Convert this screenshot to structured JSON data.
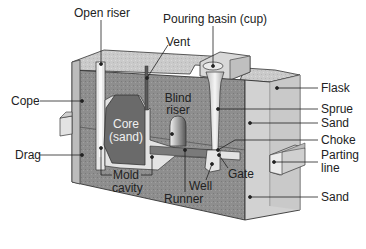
{
  "diagram": {
    "colors": {
      "sand_fill": "#8c8c8c",
      "sand_top": "#c9c9c9",
      "flask_side": "#d4d4d4",
      "core_fill": "#6b6b6b",
      "cavity": "#e6e6e6",
      "outline": "#333333",
      "text": "#222222"
    },
    "labels": {
      "open_riser": "Open riser",
      "pouring_basin": "Pouring basin (cup)",
      "vent": "Vent",
      "cope": "Cope",
      "flask": "Flask",
      "core_line1": "Core",
      "core_line2": "(sand)",
      "blind_riser_line1": "Blind",
      "blind_riser_line2": "riser",
      "sprue": "Sprue",
      "sand_upper": "Sand",
      "choke": "Choke",
      "drag": "Drag",
      "parting_line_line1": "Parting",
      "parting_line_line2": "line",
      "gate": "Gate",
      "mold_cavity_line1": "Mold",
      "mold_cavity_line2": "cavity",
      "well": "Well",
      "runner": "Runner",
      "sand_lower": "Sand"
    }
  }
}
